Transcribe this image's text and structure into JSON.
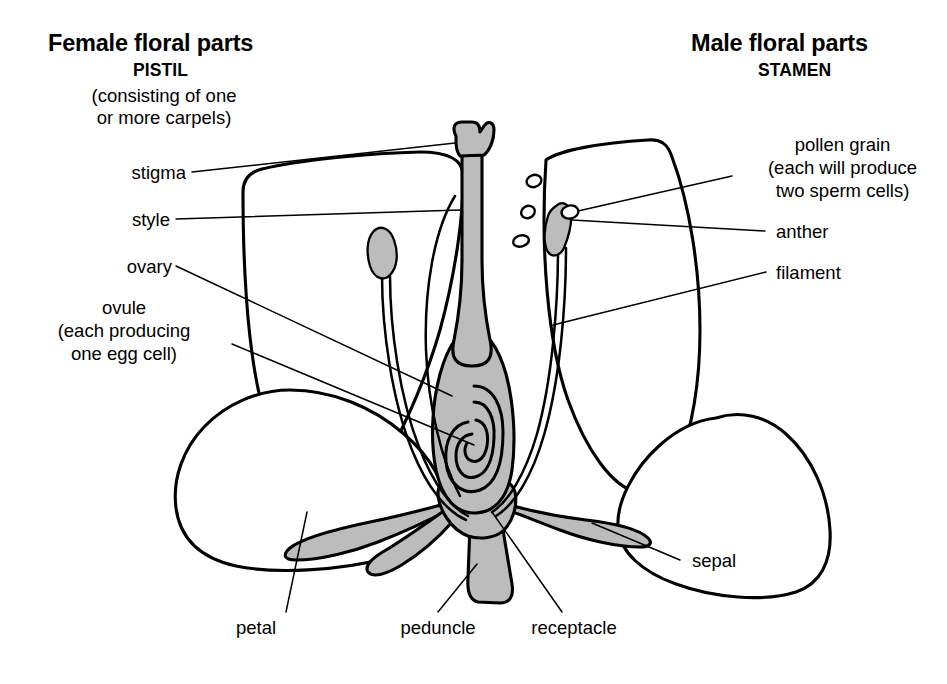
{
  "figure": {
    "background_color": "#ffffff",
    "ink_color": "#000000",
    "shaded_part_color": "#bcbcbc"
  },
  "headers": {
    "female": {
      "main": "Female floral parts",
      "sub": "PISTIL",
      "paren_line1": "(consisting of one",
      "paren_line2": "or more carpels)"
    },
    "male": {
      "main": "Male floral parts",
      "sub": "STAMEN"
    }
  },
  "labels": {
    "left": [
      {
        "id": "stigma",
        "text": "stigma"
      },
      {
        "id": "style",
        "text": "style"
      },
      {
        "id": "ovary",
        "text": "ovary"
      },
      {
        "id": "ovule",
        "line1": "ovule",
        "line2": "(each producing",
        "line3": "one egg cell)"
      }
    ],
    "right": [
      {
        "id": "pollen-grain",
        "line1": "pollen grain",
        "line2": "(each will produce",
        "line3": "two sperm cells)"
      },
      {
        "id": "anther",
        "text": "anther"
      },
      {
        "id": "filament",
        "text": "filament"
      },
      {
        "id": "sepal",
        "text": "sepal"
      }
    ],
    "bottom": [
      {
        "id": "petal",
        "text": "petal"
      },
      {
        "id": "peduncle",
        "text": "peduncle"
      },
      {
        "id": "receptacle",
        "text": "receptacle"
      }
    ]
  },
  "parts": {
    "pistil": {
      "stigma": "stigma",
      "style": "style",
      "ovary": "ovary",
      "ovule": "ovule"
    },
    "stamen": {
      "anther": "anther",
      "filament": "filament",
      "pollen_grain": "pollen grain"
    },
    "accessory": {
      "petal": "petal",
      "sepal": "sepal",
      "receptacle": "receptacle",
      "peduncle": "peduncle"
    },
    "pollen_grain_count": 4,
    "stamen_count": 2,
    "visible_petal_count": 4,
    "visible_sepal_count": 3
  }
}
